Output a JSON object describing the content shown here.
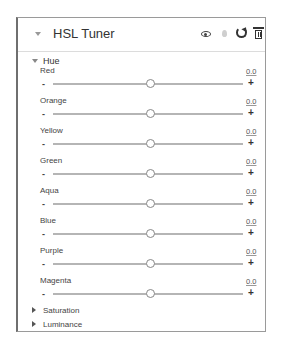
{
  "panel": {
    "title": "HSL Tuner",
    "icons": [
      "eye-icon",
      "drop-icon",
      "reset-icon",
      "trash-icon"
    ]
  },
  "hue": {
    "label": "Hue",
    "expanded": true,
    "sliders": [
      {
        "label": "Red",
        "value": "0.0",
        "min_label": "-",
        "max_label": "+"
      },
      {
        "label": "Orange",
        "value": "0.0",
        "min_label": "-",
        "max_label": "+"
      },
      {
        "label": "Yellow",
        "value": "0.0",
        "min_label": "-",
        "max_label": "+"
      },
      {
        "label": "Green",
        "value": "0.0",
        "min_label": "-",
        "max_label": "+"
      },
      {
        "label": "Aqua",
        "value": "0.0",
        "min_label": "-",
        "max_label": "+"
      },
      {
        "label": "Blue",
        "value": "0.0",
        "min_label": "-",
        "max_label": "+"
      },
      {
        "label": "Purple",
        "value": "0.0",
        "min_label": "-",
        "max_label": "+"
      },
      {
        "label": "Magenta",
        "value": "0.0",
        "min_label": "-",
        "max_label": "+"
      }
    ]
  },
  "sections": [
    {
      "label": "Saturation",
      "expanded": false
    },
    {
      "label": "Luminance",
      "expanded": false
    }
  ]
}
